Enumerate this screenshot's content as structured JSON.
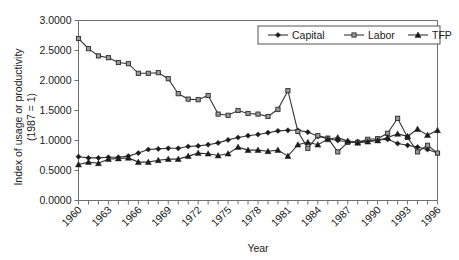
{
  "chart_data": {
    "type": "line",
    "title": "",
    "xlabel": "Year",
    "ylabel": "Index of usage or productivity (1987 = 1)",
    "ylabel_line1": "Index of usage or productivity",
    "ylabel_line2": "(1987 = 1)",
    "xlim": [
      1960,
      1996
    ],
    "ylim": [
      0.0,
      3.0
    ],
    "grid": false,
    "legend_position": "top-right",
    "y_ticks": [
      "0.0000",
      "0.5000",
      "1.0000",
      "1.5000",
      "2.0000",
      "2.5000",
      "3.0000"
    ],
    "y_tick_values": [
      0.0,
      0.5,
      1.0,
      1.5,
      2.0,
      2.5,
      3.0
    ],
    "x_tick_labels": [
      "1960",
      "1963",
      "1966",
      "1969",
      "1972",
      "1975",
      "1978",
      "1981",
      "1984",
      "1987",
      "1990",
      "1993",
      "1996"
    ],
    "x_tick_label_values": [
      1960,
      1963,
      1966,
      1969,
      1972,
      1975,
      1978,
      1981,
      1984,
      1987,
      1990,
      1993,
      1996
    ],
    "x": [
      1960,
      1961,
      1962,
      1963,
      1964,
      1965,
      1966,
      1967,
      1968,
      1969,
      1970,
      1971,
      1972,
      1973,
      1974,
      1975,
      1976,
      1977,
      1978,
      1979,
      1980,
      1981,
      1982,
      1983,
      1984,
      1985,
      1986,
      1987,
      1988,
      1989,
      1990,
      1991,
      1992,
      1993,
      1994,
      1995,
      1996
    ],
    "series": [
      {
        "name": "Capital",
        "marker": "diamond",
        "color": "#1c1c1c",
        "values": [
          0.73,
          0.71,
          0.71,
          0.72,
          0.72,
          0.74,
          0.79,
          0.85,
          0.86,
          0.87,
          0.87,
          0.9,
          0.91,
          0.93,
          0.96,
          1.01,
          1.05,
          1.08,
          1.1,
          1.13,
          1.16,
          1.17,
          1.17,
          1.14,
          1.07,
          1.03,
          1.0,
          0.98,
          0.98,
          0.99,
          1.01,
          1.02,
          0.95,
          0.92,
          0.89,
          0.85,
          0.79
        ],
        "ylim": [
          0.0,
          3.0
        ]
      },
      {
        "name": "Labor",
        "marker": "square",
        "color": "#9a9a9a",
        "values": [
          2.7,
          2.53,
          2.41,
          2.38,
          2.3,
          2.28,
          2.12,
          2.12,
          2.13,
          2.03,
          1.78,
          1.69,
          1.68,
          1.75,
          1.44,
          1.42,
          1.5,
          1.45,
          1.44,
          1.4,
          1.52,
          1.83,
          1.15,
          0.87,
          1.08,
          1.04,
          0.81,
          0.97,
          0.97,
          1.02,
          1.03,
          1.12,
          1.37,
          1.05,
          0.81,
          0.92,
          0.79
        ],
        "ylim": [
          0.0,
          3.0
        ]
      },
      {
        "name": "TFP",
        "marker": "triangle",
        "color": "#1c1c1c",
        "values": [
          0.6,
          0.64,
          0.62,
          0.69,
          0.7,
          0.71,
          0.64,
          0.64,
          0.67,
          0.69,
          0.69,
          0.74,
          0.79,
          0.78,
          0.75,
          0.78,
          0.89,
          0.84,
          0.84,
          0.82,
          0.84,
          0.74,
          0.93,
          0.97,
          0.93,
          1.02,
          1.05,
          0.99,
          0.96,
          0.98,
          1.0,
          1.05,
          1.11,
          1.07,
          1.19,
          1.09,
          1.17
        ],
        "ylim": [
          0.0,
          3.0
        ]
      }
    ]
  },
  "legend": {
    "entries": [
      {
        "label": "Capital",
        "marker": "diamond"
      },
      {
        "label": "Labor",
        "marker": "square"
      },
      {
        "label": "TFP",
        "marker": "triangle"
      }
    ]
  }
}
